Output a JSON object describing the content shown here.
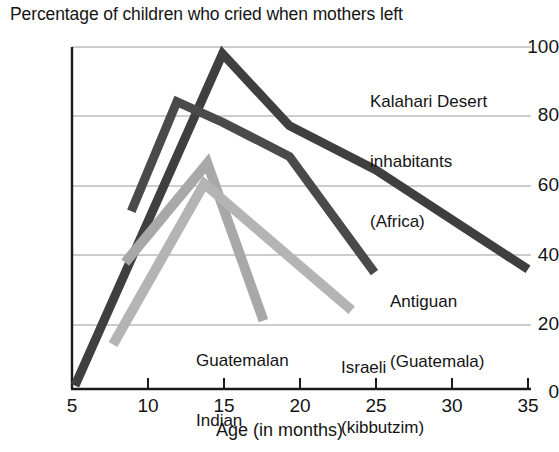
{
  "chart_data": {
    "type": "line",
    "title": "Percentage of children who cried when mothers left",
    "xlabel": "Age (in months)",
    "ylabel": "",
    "xlim": [
      5,
      35
    ],
    "ylim": [
      0,
      100
    ],
    "xticks": [
      5,
      10,
      15,
      20,
      25,
      30,
      35
    ],
    "yticks": [
      0,
      20,
      40,
      60,
      80,
      100
    ],
    "grid": "horizontal",
    "legend_position": "inline-annotations",
    "series": [
      {
        "name": "Kalahari Desert inhabitants (Africa)",
        "label_lines": [
          "Kalahari Desert",
          "inhabitants",
          "(Africa)"
        ],
        "color": "#3f3f3f",
        "x": [
          5.2,
          14.9,
          19.3,
          25.0,
          35.0
        ],
        "y": [
          1,
          98,
          77,
          64,
          35
        ]
      },
      {
        "name": "Antiguan (Guatemala)",
        "label_lines": [
          "Antiguan",
          "(Guatemala)"
        ],
        "color": "#4a4a4a",
        "x": [
          8.9,
          11.9,
          14.9,
          19.3,
          24.9
        ],
        "y": [
          52,
          84,
          78,
          68,
          34
        ]
      },
      {
        "name": "Guatemalan Indian",
        "label_lines": [
          "Guatemalan",
          "Indian"
        ],
        "color": "#a8a8a8",
        "x": [
          8.5,
          13.9,
          17.6
        ],
        "y": [
          37,
          66,
          20
        ]
      },
      {
        "name": "Israeli (kibbutzim)",
        "label_lines": [
          "Israeli",
          "(kibbutzim)"
        ],
        "color": "#b4b4b4",
        "x": [
          7.7,
          13.7,
          23.4
        ],
        "y": [
          13,
          60,
          23
        ]
      }
    ]
  },
  "annotations": {
    "kalahari": {
      "line1": "Kalahari Desert",
      "line2": "inhabitants",
      "line3": "(Africa)"
    },
    "antiguan": {
      "line1": "Antiguan",
      "line2": "(Guatemala)"
    },
    "guatemalan": {
      "line1": "Guatemalan",
      "line2": "Indian"
    },
    "israeli": {
      "line1": "Israeli",
      "line2": "(kibbutzim)"
    }
  },
  "axes": {
    "y_labels": [
      "100",
      "80",
      "60",
      "40",
      "20",
      "0"
    ],
    "x_labels": [
      "5",
      "10",
      "15",
      "20",
      "25",
      "30",
      "35"
    ]
  }
}
